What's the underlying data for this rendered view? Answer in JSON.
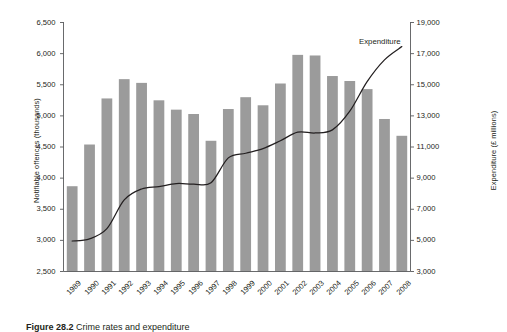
{
  "chart_data": {
    "type": "bar",
    "title": "",
    "subtitle": "",
    "xlabel": "",
    "ylabel": "Notifiable offences (thousands)",
    "y2label": "Expenditure (£ millions)",
    "grid": false,
    "legend_position": "inline-right",
    "categories": [
      "1989",
      "1990",
      "1991",
      "1992",
      "1993",
      "1994",
      "1995",
      "1996",
      "1997",
      "1998",
      "1999",
      "2000",
      "2001",
      "2002",
      "2003",
      "2004",
      "2005",
      "2006",
      "2007",
      "2008"
    ],
    "ylim": [
      2500,
      6500
    ],
    "yticks": [
      "2,500",
      "3,000",
      "3,500",
      "4,000",
      "4,500",
      "5,000",
      "5,500",
      "6,000",
      "6,500"
    ],
    "y2lim": [
      3000,
      19000
    ],
    "y2ticks": [
      "3,000",
      "5,000",
      "7,000",
      "9,000",
      "11,000",
      "13,000",
      "15,000",
      "17,000",
      "19,000"
    ],
    "series": [
      {
        "name": "Notifiable offences",
        "type": "bar",
        "axis": "left",
        "color": "#9b9b9b",
        "values": [
          3870,
          4540,
          5280,
          5590,
          5530,
          5250,
          5100,
          5030,
          4600,
          5110,
          5300,
          5170,
          5520,
          5980,
          5970,
          5640,
          5560,
          5430,
          4950,
          4680
        ]
      },
      {
        "name": "Expenditure",
        "type": "line",
        "axis": "right",
        "color": "#231f20",
        "values": [
          4960,
          5100,
          5750,
          7600,
          8300,
          8450,
          8650,
          8620,
          8700,
          10300,
          10600,
          10900,
          11400,
          11950,
          11900,
          12100,
          13300,
          15200,
          16600,
          17450
        ]
      }
    ]
  },
  "labels": {
    "series_annotation": "Expenditure"
  },
  "caption": {
    "number": "Figure 28.2",
    "text": "Crime rates and expenditure"
  }
}
